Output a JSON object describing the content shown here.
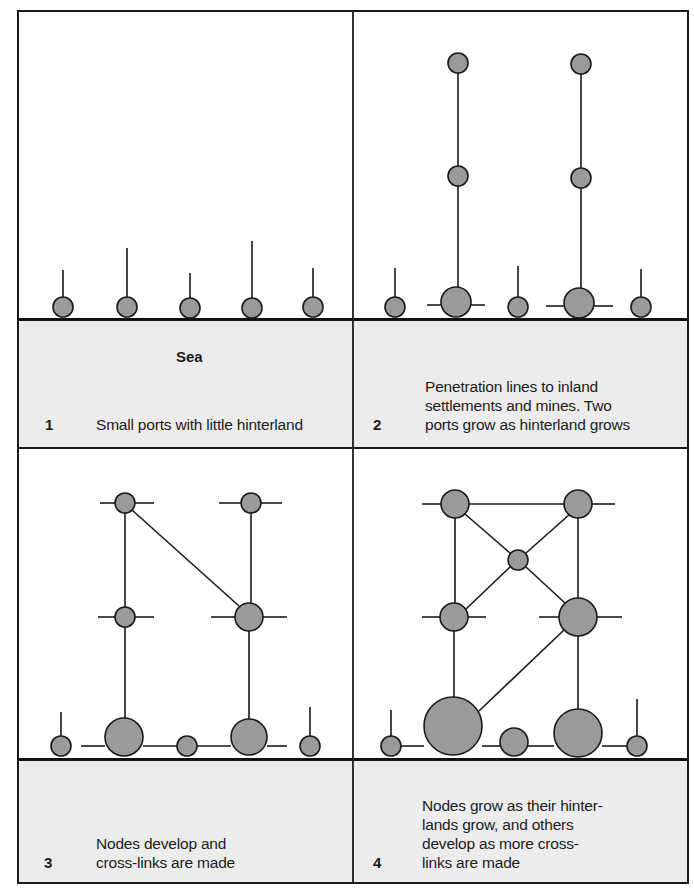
{
  "colors": {
    "land": "#ffffff",
    "sea": "#ececec",
    "node_fill": "#9a9a9a",
    "stroke": "#1a1a1a"
  },
  "labels": {
    "sea": "Sea"
  },
  "panels": [
    {
      "number": "1",
      "caption": "Small ports with little hinterland",
      "nodes": [
        {
          "x": 63,
          "y": 307,
          "r": 10
        },
        {
          "x": 127,
          "y": 307,
          "r": 10
        },
        {
          "x": 190,
          "y": 308,
          "r": 10
        },
        {
          "x": 252,
          "y": 308,
          "r": 10
        },
        {
          "x": 313,
          "y": 307,
          "r": 10
        }
      ],
      "lines": [
        [
          63,
          297,
          63,
          270
        ],
        [
          127,
          297,
          127,
          248
        ],
        [
          190,
          298,
          190,
          273
        ],
        [
          252,
          298,
          252,
          241
        ],
        [
          313,
          297,
          313,
          268
        ]
      ]
    },
    {
      "number": "2",
      "caption": "Penetration lines to inland\nsettlements and mines. Two\nports grow as hinterland grows",
      "nodes": [
        {
          "x": 458,
          "y": 63,
          "r": 10
        },
        {
          "x": 581,
          "y": 64,
          "r": 10
        },
        {
          "x": 458,
          "y": 176,
          "r": 10
        },
        {
          "x": 581,
          "y": 178,
          "r": 10
        },
        {
          "x": 395,
          "y": 307,
          "r": 10
        },
        {
          "x": 456,
          "y": 302,
          "r": 15
        },
        {
          "x": 518,
          "y": 307,
          "r": 10
        },
        {
          "x": 579,
          "y": 303,
          "r": 15
        },
        {
          "x": 641,
          "y": 307,
          "r": 10
        }
      ],
      "lines": [
        [
          458,
          73,
          458,
          166
        ],
        [
          458,
          186,
          458,
          287
        ],
        [
          581,
          74,
          581,
          168
        ],
        [
          581,
          188,
          581,
          288
        ],
        [
          395,
          297,
          395,
          268
        ],
        [
          518,
          297,
          518,
          266
        ],
        [
          641,
          297,
          641,
          269
        ],
        [
          427,
          305,
          441,
          305
        ],
        [
          471,
          305,
          485,
          305
        ],
        [
          546,
          306,
          564,
          306
        ],
        [
          594,
          306,
          613,
          306
        ]
      ]
    },
    {
      "number": "3",
      "caption": "Nodes develop and\ncross-links are made",
      "nodes": [
        {
          "x": 125,
          "y": 503,
          "r": 10
        },
        {
          "x": 251,
          "y": 503,
          "r": 10
        },
        {
          "x": 125,
          "y": 617,
          "r": 10
        },
        {
          "x": 249,
          "y": 617,
          "r": 14
        },
        {
          "x": 61,
          "y": 746,
          "r": 10
        },
        {
          "x": 124,
          "y": 737,
          "r": 19
        },
        {
          "x": 187,
          "y": 746,
          "r": 10
        },
        {
          "x": 249,
          "y": 737,
          "r": 18
        },
        {
          "x": 310,
          "y": 746,
          "r": 10
        }
      ],
      "lines": [
        [
          100,
          503,
          115,
          503
        ],
        [
          135,
          503,
          154,
          503
        ],
        [
          219,
          503,
          241,
          503
        ],
        [
          261,
          503,
          282,
          503
        ],
        [
          98,
          617,
          115,
          617
        ],
        [
          135,
          617,
          154,
          617
        ],
        [
          211,
          617,
          235,
          617
        ],
        [
          263,
          617,
          287,
          617
        ],
        [
          125,
          513,
          125,
          607
        ],
        [
          251,
          513,
          251,
          603
        ],
        [
          132,
          510,
          239,
          606
        ],
        [
          125,
          627,
          125,
          718
        ],
        [
          249,
          631,
          249,
          719
        ],
        [
          61,
          736,
          61,
          712
        ],
        [
          310,
          736,
          310,
          707
        ],
        [
          81,
          746,
          105,
          746
        ],
        [
          143,
          746,
          177,
          746
        ],
        [
          197,
          746,
          231,
          746
        ],
        [
          267,
          746,
          287,
          746
        ]
      ]
    },
    {
      "number": "4",
      "caption": "Nodes grow as their hinter-\nlands grow, and others\ndevelop as more cross-\nlinks are made",
      "nodes": [
        {
          "x": 455,
          "y": 504,
          "r": 14
        },
        {
          "x": 578,
          "y": 504,
          "r": 14
        },
        {
          "x": 518,
          "y": 560,
          "r": 10
        },
        {
          "x": 454,
          "y": 617,
          "r": 14
        },
        {
          "x": 578,
          "y": 617,
          "r": 19
        },
        {
          "x": 453,
          "y": 726,
          "r": 29
        },
        {
          "x": 391,
          "y": 746,
          "r": 10
        },
        {
          "x": 514,
          "y": 742,
          "r": 14
        },
        {
          "x": 578,
          "y": 733,
          "r": 24
        },
        {
          "x": 637,
          "y": 746,
          "r": 10
        }
      ],
      "lines": [
        [
          422,
          504,
          441,
          504
        ],
        [
          469,
          504,
          564,
          504
        ],
        [
          592,
          504,
          615,
          504
        ],
        [
          465,
          514,
          510,
          553
        ],
        [
          570,
          514,
          526,
          553
        ],
        [
          455,
          518,
          455,
          603
        ],
        [
          578,
          518,
          578,
          598
        ],
        [
          510,
          567,
          466,
          609
        ],
        [
          526,
          567,
          565,
          603
        ],
        [
          422,
          617,
          440,
          617
        ],
        [
          468,
          617,
          486,
          617
        ],
        [
          539,
          617,
          559,
          617
        ],
        [
          597,
          617,
          622,
          617
        ],
        [
          454,
          631,
          454,
          697
        ],
        [
          578,
          636,
          578,
          709
        ],
        [
          564,
          630,
          479,
          711
        ],
        [
          391,
          736,
          391,
          710
        ],
        [
          637,
          736,
          637,
          699
        ],
        [
          401,
          746,
          424,
          746
        ],
        [
          482,
          746,
          500,
          746
        ],
        [
          528,
          746,
          554,
          746
        ],
        [
          602,
          746,
          627,
          746
        ]
      ]
    }
  ]
}
